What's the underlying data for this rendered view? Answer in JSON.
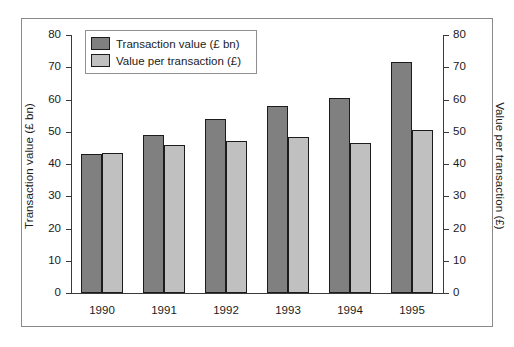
{
  "chart_data": {
    "type": "bar",
    "title": "",
    "xlabel": "",
    "categories": [
      "1990",
      "1991",
      "1992",
      "1993",
      "1994",
      "1995"
    ],
    "series": [
      {
        "name": "Transaction value (£ bn)",
        "axis": "left",
        "color": "#808080",
        "values": [
          43,
          49,
          54,
          58,
          60.5,
          71.5
        ]
      },
      {
        "name": "Value per transaction (£)",
        "axis": "right",
        "color": "#c0c0c0",
        "values": [
          43.5,
          46,
          47,
          48.5,
          46.5,
          50.5
        ]
      }
    ],
    "left_axis": {
      "label": "Transaction value (£ bn)",
      "ticks": [
        "0",
        "10",
        "20",
        "30",
        "40",
        "50",
        "60",
        "70",
        "80"
      ],
      "ylim": [
        0,
        80
      ]
    },
    "right_axis": {
      "label": "Value per transaction (£)",
      "ticks": [
        "0",
        "10",
        "20",
        "30",
        "40",
        "50",
        "60",
        "70",
        "80"
      ],
      "ylim": [
        0,
        80
      ]
    },
    "legend": {
      "position": "top-left",
      "entries": [
        {
          "label": "Transaction value (£ bn)",
          "color": "#808080"
        },
        {
          "label": "Value per transaction (£)",
          "color": "#c0c0c0"
        }
      ]
    },
    "grid": false
  }
}
